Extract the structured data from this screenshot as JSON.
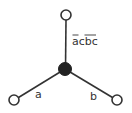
{
  "diagram": {
    "type": "star-graph",
    "nodes": [
      {
        "id": "top",
        "x": 66,
        "y": 15,
        "r": 5,
        "filled": false
      },
      {
        "id": "center",
        "x": 65,
        "y": 69,
        "r": 6,
        "filled": true
      },
      {
        "id": "left",
        "x": 14,
        "y": 100,
        "r": 5,
        "filled": false
      },
      {
        "id": "right",
        "x": 117,
        "y": 100,
        "r": 5,
        "filled": false
      }
    ],
    "edges": [
      {
        "from": "center",
        "to": "top",
        "label_parts": [
          {
            "text": "a",
            "overline": true
          },
          {
            "text": "c",
            "overline": false
          },
          {
            "text": "bc",
            "overline": true
          }
        ],
        "label_text": "āc(bc)̄"
      },
      {
        "from": "center",
        "to": "left",
        "label": "a"
      },
      {
        "from": "center",
        "to": "right",
        "label": "b"
      }
    ],
    "colors": {
      "stroke": "#333333",
      "fill_center": "#222222",
      "fill_leaf": "#ffffff"
    }
  }
}
